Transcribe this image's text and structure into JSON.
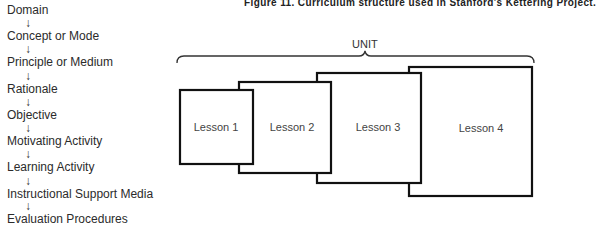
{
  "figure": {
    "title": "Figure 11. Curriculum structure used in Stanford's Kettering Project."
  },
  "flow": {
    "items": [
      {
        "label": "Domain",
        "top": 3
      },
      {
        "label": "Concept or Mode",
        "top": 29
      },
      {
        "label": "Principle or Medium",
        "top": 55
      },
      {
        "label": "Rationale",
        "top": 82
      },
      {
        "label": "Objective",
        "top": 108
      },
      {
        "label": "Motivating Activity",
        "top": 134
      },
      {
        "label": "Learning Activity",
        "top": 160
      },
      {
        "label": "Instructional Support Media",
        "top": 187
      },
      {
        "label": "Evaluation Procedures",
        "top": 212
      }
    ],
    "arrow": "↓"
  },
  "unit": {
    "label": "UNIT"
  },
  "lessons": [
    {
      "label": "Lesson 1",
      "x": 180,
      "y": 90,
      "w": 73,
      "h": 74
    },
    {
      "label": "Lesson 2",
      "x": 239,
      "y": 82,
      "w": 92,
      "h": 91
    },
    {
      "label": "Lesson 3",
      "x": 317,
      "y": 73,
      "w": 104,
      "h": 110
    },
    {
      "label": "Lesson 4",
      "x": 409,
      "y": 67,
      "w": 123,
      "h": 129
    }
  ]
}
